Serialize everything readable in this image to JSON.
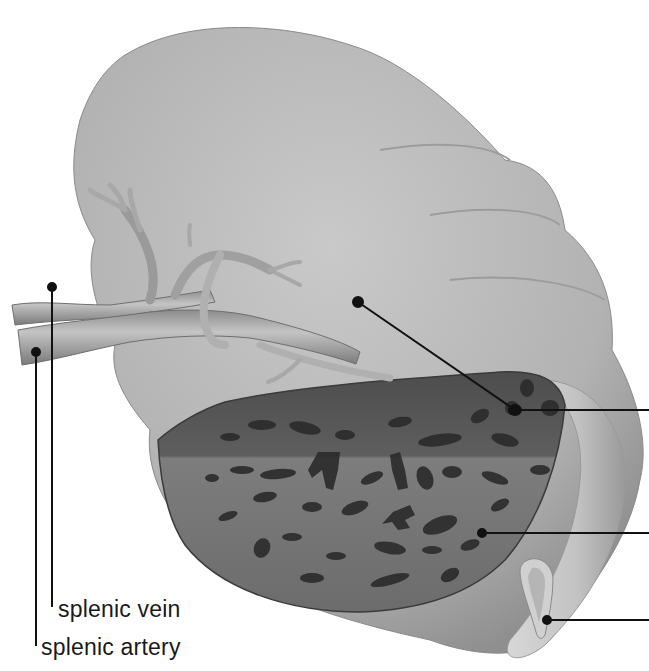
{
  "figure": {
    "style": "greyscale anatomical illustration with cut-away section"
  },
  "labels": {
    "splenic_vein": "splenic vein",
    "splenic_artery": "splenic artery"
  },
  "leaders": [
    {
      "id": "splenic-vein-leader",
      "label": "splenic vein",
      "dot": [
        52,
        287
      ],
      "end": [
        52,
        607
      ]
    },
    {
      "id": "splenic-artery-leader",
      "label": "splenic artery",
      "dot": [
        36,
        352
      ],
      "end": [
        36,
        646
      ]
    },
    {
      "id": "right-leader-1",
      "label": "",
      "dot": [
        355,
        301
      ],
      "bend": [
        515,
        410
      ],
      "end": [
        649,
        410
      ]
    },
    {
      "id": "right-leader-2",
      "label": "",
      "dot": [
        482,
        533
      ],
      "end": [
        649,
        533
      ]
    },
    {
      "id": "right-leader-3",
      "label": "",
      "dot": [
        547,
        620
      ],
      "end": [
        649,
        620
      ]
    }
  ],
  "colors": {
    "background": "#ffffff",
    "capsule": "#b3b3b3",
    "capsule_highlight": "#d4d4d4",
    "red_pulp_dark": "#4a4a4a",
    "pulp_mid": "#7a7a7a",
    "white_pulp": "#2b2b2b",
    "vessel": "#a6a6a6",
    "leader": "#111111",
    "text": "#1a1a1a"
  }
}
